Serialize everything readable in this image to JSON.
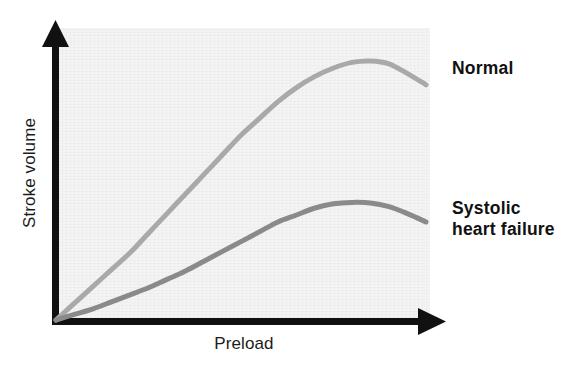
{
  "chart_data": {
    "type": "line",
    "title": "",
    "subtitle": "",
    "xlabel": "Preload",
    "ylabel": "Stroke volume",
    "xlim": [
      0,
      100
    ],
    "ylim": [
      0,
      100
    ],
    "grid": false,
    "axis_ticks": false,
    "legend_position": "right-inline-labels",
    "background_color": "#f4f4f4",
    "axis_color": "#111111",
    "annotations": [],
    "series": [
      {
        "name": "Normal",
        "color": "#a9a9a9",
        "line_width": 5,
        "label_position": "right",
        "x": [
          0,
          5,
          10,
          15,
          20,
          25,
          30,
          35,
          40,
          45,
          50,
          55,
          60,
          65,
          70,
          75,
          80,
          85,
          90,
          95,
          100
        ],
        "y": [
          0,
          6,
          12,
          18,
          24,
          31,
          38,
          45,
          52,
          59,
          66,
          72,
          78,
          83,
          87,
          90,
          92,
          92.5,
          91.5,
          88,
          84
        ]
      },
      {
        "name": "Systolic heart failure",
        "color": "#8a8a8a",
        "line_width": 5,
        "label_position": "right",
        "x": [
          0,
          5,
          10,
          15,
          20,
          25,
          30,
          35,
          40,
          45,
          50,
          55,
          60,
          65,
          70,
          75,
          80,
          85,
          90,
          95,
          100
        ],
        "y": [
          0,
          2,
          4,
          6.5,
          9,
          11.5,
          14.5,
          17.5,
          21,
          24.5,
          28,
          31.5,
          35,
          37.5,
          40,
          41.5,
          42,
          41.8,
          40.5,
          38,
          35
        ]
      }
    ]
  },
  "axes": {
    "x_axis_label": "Preload",
    "y_axis_label": "Stroke volume",
    "x_arrow": "right-arrowhead",
    "y_arrow": "up-arrowhead"
  },
  "labels": {
    "normal": "Normal",
    "failure": "Systolic\nheart failure"
  }
}
